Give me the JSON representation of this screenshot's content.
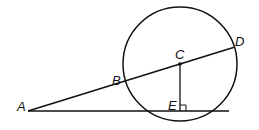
{
  "diagram": {
    "type": "geometry",
    "colors": {
      "stroke": "#111111",
      "background": "#ffffff"
    },
    "points": {
      "A": {
        "label": "A",
        "x": 28,
        "y": 111
      },
      "B": {
        "label": "B",
        "x": 124,
        "y": 81
      },
      "C": {
        "label": "C",
        "x": 180,
        "y": 64
      },
      "D": {
        "label": "D",
        "x": 235,
        "y": 47
      },
      "E": {
        "label": "E",
        "x": 180,
        "y": 111
      }
    },
    "circle": {
      "center": "C",
      "cx": 180,
      "cy": 64,
      "r": 57
    },
    "segments": [
      {
        "from": "A",
        "to": "D"
      },
      {
        "from": "A",
        "to": "line-end"
      },
      {
        "from": "C",
        "to": "E"
      }
    ],
    "right_angle": {
      "at": "E"
    }
  }
}
